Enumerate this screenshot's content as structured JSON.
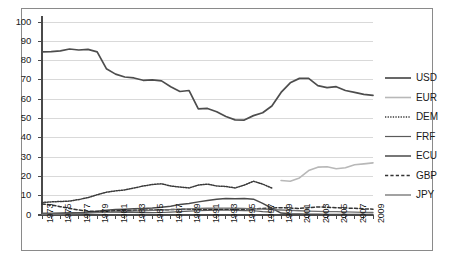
{
  "chart_data": {
    "type": "line",
    "title": "",
    "subtitle": "",
    "xlabel": "",
    "ylabel": "",
    "xlim": [
      1973,
      2009
    ],
    "ylim": [
      0,
      100
    ],
    "grid": true,
    "legend_position": "right",
    "x": [
      1973,
      1974,
      1975,
      1976,
      1977,
      1978,
      1979,
      1980,
      1981,
      1982,
      1983,
      1984,
      1985,
      1986,
      1987,
      1988,
      1989,
      1990,
      1991,
      1992,
      1993,
      1994,
      1995,
      1996,
      1997,
      1998,
      1999,
      2000,
      2001,
      2002,
      2003,
      2004,
      2005,
      2006,
      2007,
      2008,
      2009
    ],
    "x_tick_labels": [
      "1973",
      "1975",
      "1977",
      "1979",
      "1981",
      "1983",
      "1985",
      "1987",
      "1989",
      "1991",
      "1993",
      "1995",
      "1997",
      "1999",
      "2001",
      "2003",
      "2005",
      "2007",
      "2009"
    ],
    "y_tick_labels": [
      "0",
      "10",
      "20",
      "30",
      "40",
      "50",
      "60",
      "70",
      "80",
      "90",
      "100"
    ],
    "series": [
      {
        "name": "USD",
        "color": "#4d4d4d",
        "dash": "none",
        "width": 1.7,
        "values": [
          84.5,
          84.6,
          85.0,
          86.0,
          85.5,
          85.8,
          84.5,
          75.8,
          73.0,
          71.5,
          71.0,
          69.8,
          70.0,
          69.5,
          66.5,
          64.0,
          64.5,
          55.0,
          55.2,
          53.5,
          51.0,
          49.3,
          49.2,
          51.5,
          53.0,
          56.5,
          63.5,
          68.5,
          70.8,
          70.8,
          67.0,
          66.0,
          66.5,
          64.5,
          63.5,
          62.5,
          62.0
        ]
      },
      {
        "name": "EUR",
        "color": "#b8b8b8",
        "dash": "none",
        "width": 1.6,
        "values": [
          null,
          null,
          null,
          null,
          null,
          null,
          null,
          null,
          null,
          null,
          null,
          null,
          null,
          null,
          null,
          null,
          null,
          null,
          null,
          null,
          null,
          null,
          null,
          null,
          null,
          null,
          17.9,
          17.5,
          19.2,
          23.0,
          24.8,
          25.0,
          24.0,
          24.5,
          26.0,
          26.5,
          27.0
        ]
      },
      {
        "name": "DEM",
        "color": "#3a3a3a",
        "dash": "1.3,1.3",
        "width": 1.5,
        "values": [
          6.5,
          6.8,
          7.0,
          7.2,
          8.0,
          9.0,
          10.5,
          11.8,
          12.5,
          13.0,
          14.0,
          15.0,
          15.8,
          16.2,
          15.0,
          14.5,
          14.0,
          15.5,
          16.0,
          15.0,
          14.8,
          14.0,
          15.5,
          17.5,
          16.0,
          14.0,
          null,
          null,
          null,
          null,
          null,
          null,
          null,
          null,
          null,
          null,
          null
        ]
      },
      {
        "name": "FRF",
        "color": "#5a5a5a",
        "dash": "none",
        "width": 1.2,
        "values": [
          1.0,
          1.0,
          1.1,
          1.2,
          1.3,
          1.3,
          1.4,
          1.5,
          1.5,
          1.4,
          1.3,
          1.2,
          1.2,
          1.3,
          1.5,
          1.8,
          2.0,
          2.2,
          2.4,
          2.5,
          2.6,
          2.4,
          2.3,
          2.2,
          1.8,
          1.5,
          null,
          null,
          null,
          null,
          null,
          null,
          null,
          null,
          null,
          null,
          null
        ]
      },
      {
        "name": "ECU",
        "color": "#4a4a4a",
        "dash": "none",
        "width": 1.5,
        "values": [
          0.5,
          0.5,
          0.6,
          0.8,
          1.0,
          1.4,
          2.0,
          2.5,
          2.8,
          3.0,
          3.2,
          3.4,
          3.6,
          4.0,
          4.5,
          5.5,
          6.0,
          6.8,
          7.5,
          8.2,
          8.6,
          8.4,
          8.6,
          8.2,
          6.0,
          3.5,
          1.0,
          0.6,
          0.5,
          0.4,
          0.4,
          0.3,
          0.3,
          0.3,
          0.3,
          0.3,
          0.3
        ]
      },
      {
        "name": "GBP",
        "color": "#333333",
        "dash": "3.2,2.2",
        "width": 1.5,
        "values": [
          5.7,
          5.2,
          4.3,
          3.4,
          2.6,
          2.0,
          1.8,
          2.0,
          2.2,
          2.3,
          2.4,
          2.5,
          2.6,
          2.7,
          2.8,
          2.9,
          3.0,
          3.0,
          3.0,
          3.0,
          3.0,
          3.0,
          3.0,
          3.2,
          3.4,
          3.6,
          3.8,
          3.6,
          3.4,
          3.8,
          4.2,
          4.0,
          3.8,
          3.6,
          3.5,
          3.2,
          3.0
        ]
      },
      {
        "name": "JPY",
        "color": "#707070",
        "dash": "none",
        "width": 1.3,
        "values": [
          0.3,
          0.3,
          0.4,
          0.5,
          0.7,
          1.0,
          1.2,
          1.4,
          1.6,
          1.8,
          2.0,
          2.2,
          2.4,
          2.6,
          2.8,
          3.0,
          3.2,
          3.4,
          3.5,
          3.6,
          3.6,
          3.5,
          3.4,
          3.2,
          3.0,
          2.8,
          2.6,
          2.4,
          2.2,
          2.0,
          1.9,
          1.8,
          1.7,
          1.6,
          1.5,
          1.4,
          1.3
        ]
      }
    ]
  },
  "legend": {
    "entries": [
      {
        "label": "USD"
      },
      {
        "label": "EUR"
      },
      {
        "label": "DEM"
      },
      {
        "label": "FRF"
      },
      {
        "label": "ECU"
      },
      {
        "label": "GBP"
      },
      {
        "label": "JPY"
      }
    ]
  },
  "style": {
    "grid_color": "#d9d9d9",
    "axis_color": "#4a4a4a",
    "frame_color": "#8a8a8a",
    "text_color": "#1a1a1a",
    "background": "#ffffff"
  }
}
